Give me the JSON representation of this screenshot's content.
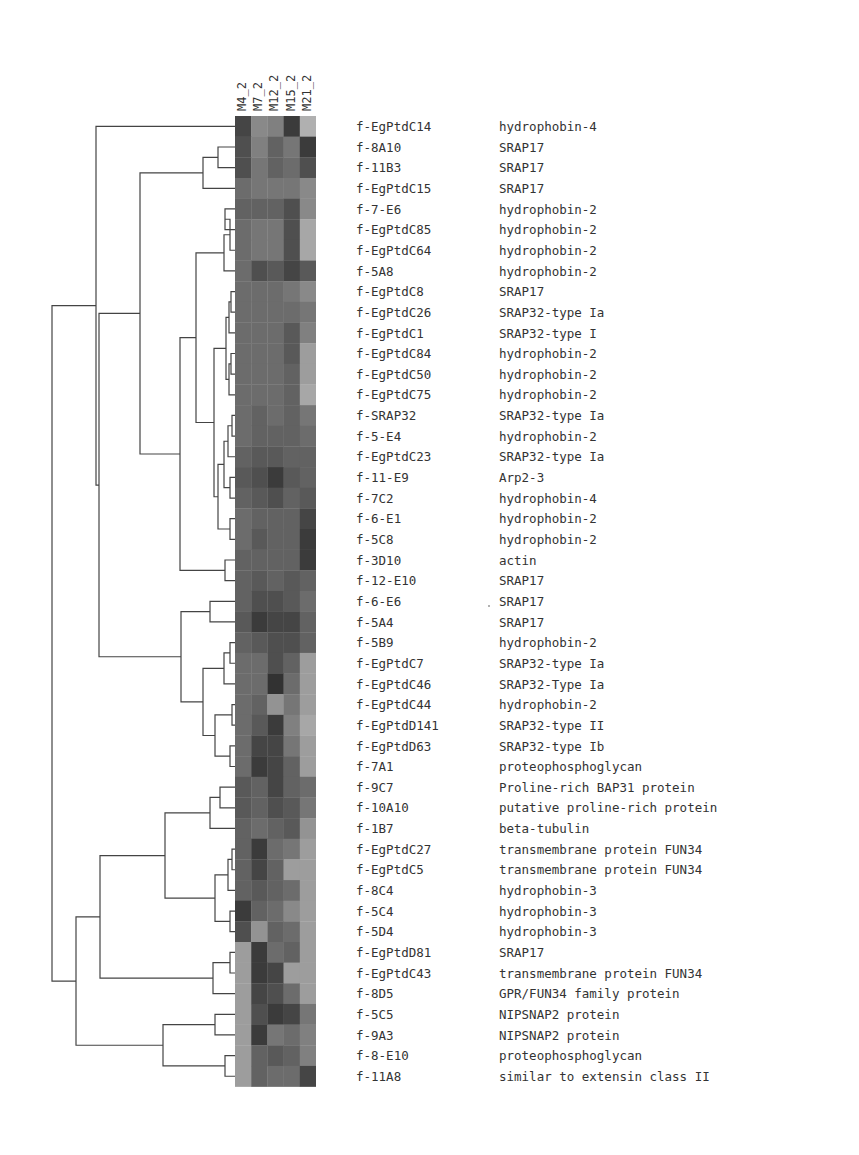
{
  "chart_data": {
    "type": "heatmap",
    "title": "",
    "columns": [
      "M4_2",
      "M7_2",
      "M12_2",
      "M15_2",
      "M21_2"
    ],
    "rows": [
      {
        "id": "f-EgPtdC14",
        "annotation": "hydrophobin-4",
        "values": [
          0.2,
          0.55,
          0.5,
          0.15,
          0.75
        ]
      },
      {
        "id": "f-8A10",
        "annotation": "SRAP17",
        "values": [
          0.25,
          0.5,
          0.35,
          0.45,
          0.15
        ]
      },
      {
        "id": "f-11B3",
        "annotation": "SRAP17",
        "values": [
          0.25,
          0.45,
          0.35,
          0.4,
          0.25
        ]
      },
      {
        "id": "f-EgPtdC15",
        "annotation": "SRAP17",
        "values": [
          0.4,
          0.45,
          0.45,
          0.45,
          0.55
        ]
      },
      {
        "id": "f-7-E6",
        "annotation": "hydrophobin-2",
        "values": [
          0.35,
          0.35,
          0.35,
          0.25,
          0.55
        ]
      },
      {
        "id": "f-EgPtdC85",
        "annotation": "hydrophobin-2",
        "values": [
          0.4,
          0.45,
          0.45,
          0.25,
          0.7
        ]
      },
      {
        "id": "f-EgPtdC64",
        "annotation": "hydrophobin-2",
        "values": [
          0.4,
          0.45,
          0.45,
          0.25,
          0.7
        ]
      },
      {
        "id": "f-5A8",
        "annotation": "hydrophobin-2",
        "values": [
          0.4,
          0.25,
          0.3,
          0.2,
          0.3
        ]
      },
      {
        "id": "f-EgPtdC8",
        "annotation": "SRAP17",
        "values": [
          0.4,
          0.4,
          0.4,
          0.45,
          0.55
        ]
      },
      {
        "id": "f-EgPtdC26",
        "annotation": "SRAP32-type Ia",
        "values": [
          0.4,
          0.4,
          0.4,
          0.4,
          0.45
        ]
      },
      {
        "id": "f-EgPtdC1",
        "annotation": "SRAP32-type I",
        "values": [
          0.4,
          0.4,
          0.4,
          0.3,
          0.5
        ]
      },
      {
        "id": "f-EgPtdC84",
        "annotation": "hydrophobin-2",
        "values": [
          0.4,
          0.4,
          0.4,
          0.3,
          0.65
        ]
      },
      {
        "id": "f-EgPtdC50",
        "annotation": "hydrophobin-2",
        "values": [
          0.4,
          0.4,
          0.4,
          0.35,
          0.65
        ]
      },
      {
        "id": "f-EgPtdC75",
        "annotation": "hydrophobin-2",
        "values": [
          0.4,
          0.4,
          0.4,
          0.35,
          0.7
        ]
      },
      {
        "id": "f-SRAP32",
        "annotation": "SRAP32-type Ia",
        "values": [
          0.4,
          0.35,
          0.4,
          0.35,
          0.45
        ]
      },
      {
        "id": "f-5-E4",
        "annotation": "hydrophobin-2",
        "values": [
          0.4,
          0.35,
          0.35,
          0.35,
          0.4
        ]
      },
      {
        "id": "f-EgPtdC23",
        "annotation": "SRAP32-type Ia",
        "values": [
          0.35,
          0.3,
          0.3,
          0.35,
          0.35
        ]
      },
      {
        "id": "f-11-E9",
        "annotation": "Arp2-3",
        "values": [
          0.3,
          0.25,
          0.15,
          0.3,
          0.35
        ]
      },
      {
        "id": "f-7C2",
        "annotation": "hydrophobin-4",
        "values": [
          0.35,
          0.3,
          0.25,
          0.35,
          0.3
        ]
      },
      {
        "id": "f-6-E1",
        "annotation": "hydrophobin-2",
        "values": [
          0.4,
          0.35,
          0.35,
          0.35,
          0.2
        ]
      },
      {
        "id": "f-5C8",
        "annotation": "hydrophobin-2",
        "values": [
          0.4,
          0.3,
          0.35,
          0.35,
          0.15
        ]
      },
      {
        "id": "f-3D10",
        "annotation": "actin",
        "values": [
          0.35,
          0.35,
          0.35,
          0.35,
          0.15
        ]
      },
      {
        "id": "f-12-E10",
        "annotation": "SRAP17",
        "values": [
          0.35,
          0.3,
          0.35,
          0.3,
          0.35
        ]
      },
      {
        "id": "f-6-E6",
        "annotation": "SRAP17",
        "values": [
          0.35,
          0.25,
          0.25,
          0.3,
          0.4
        ]
      },
      {
        "id": "f-5A4",
        "annotation": "SRAP17",
        "values": [
          0.3,
          0.15,
          0.2,
          0.2,
          0.35
        ]
      },
      {
        "id": "f-5B9",
        "annotation": "hydrophobin-2",
        "values": [
          0.35,
          0.3,
          0.25,
          0.25,
          0.35
        ]
      },
      {
        "id": "f-EgPtdC7",
        "annotation": "SRAP32-type Ia",
        "values": [
          0.4,
          0.4,
          0.25,
          0.35,
          0.65
        ]
      },
      {
        "id": "f-EgPtdC46",
        "annotation": "SRAP32-Type Ia",
        "values": [
          0.4,
          0.4,
          0.1,
          0.4,
          0.65
        ]
      },
      {
        "id": "f-EgPtdC44",
        "annotation": "hydrophobin-2",
        "values": [
          0.4,
          0.35,
          0.6,
          0.45,
          0.65
        ]
      },
      {
        "id": "f-EgPtdD141",
        "annotation": "SRAP32-type II",
        "values": [
          0.4,
          0.3,
          0.15,
          0.5,
          0.7
        ]
      },
      {
        "id": "f-EgPtdD63",
        "annotation": "SRAP32-type Ib",
        "values": [
          0.4,
          0.2,
          0.2,
          0.45,
          0.65
        ]
      },
      {
        "id": "f-7A1",
        "annotation": "proteophosphoglycan",
        "values": [
          0.4,
          0.15,
          0.2,
          0.35,
          0.65
        ]
      },
      {
        "id": "f-9C7",
        "annotation": "Proline-rich BAP31 protein",
        "values": [
          0.3,
          0.35,
          0.2,
          0.35,
          0.4
        ]
      },
      {
        "id": "f-10A10",
        "annotation": "putative proline-rich protein",
        "values": [
          0.3,
          0.35,
          0.25,
          0.3,
          0.45
        ]
      },
      {
        "id": "f-1B7",
        "annotation": "beta-tubulin",
        "values": [
          0.35,
          0.4,
          0.35,
          0.3,
          0.6
        ]
      },
      {
        "id": "f-EgPtdC27",
        "annotation": "transmembrane protein FUN34",
        "values": [
          0.35,
          0.15,
          0.4,
          0.45,
          0.65
        ]
      },
      {
        "id": "f-EgPtdC5",
        "annotation": "transmembrane protein FUN34",
        "values": [
          0.35,
          0.2,
          0.35,
          0.65,
          0.65
        ]
      },
      {
        "id": "f-8C4",
        "annotation": "hydrophobin-3",
        "values": [
          0.35,
          0.3,
          0.35,
          0.4,
          0.65
        ]
      },
      {
        "id": "f-5C4",
        "annotation": "hydrophobin-3",
        "values": [
          0.15,
          0.35,
          0.4,
          0.55,
          0.65
        ]
      },
      {
        "id": "f-5D4",
        "annotation": "hydrophobin-3",
        "values": [
          0.25,
          0.6,
          0.35,
          0.4,
          0.65
        ]
      },
      {
        "id": "f-EgPtdD81",
        "annotation": "SRAP17",
        "values": [
          0.65,
          0.15,
          0.4,
          0.35,
          0.65
        ]
      },
      {
        "id": "f-EgPtdC43",
        "annotation": "transmembrane protein FUN34",
        "values": [
          0.65,
          0.15,
          0.2,
          0.65,
          0.65
        ]
      },
      {
        "id": "f-8D5",
        "annotation": "GPR/FUN34 family protein",
        "values": [
          0.65,
          0.2,
          0.25,
          0.4,
          0.65
        ]
      },
      {
        "id": "f-5C5",
        "annotation": "NIPSNAP2 protein",
        "values": [
          0.65,
          0.25,
          0.15,
          0.2,
          0.45
        ]
      },
      {
        "id": "f-9A3",
        "annotation": "NIPSNAP2 protein",
        "values": [
          0.65,
          0.15,
          0.45,
          0.4,
          0.5
        ]
      },
      {
        "id": "f-8-E10",
        "annotation": "proteophosphoglycan",
        "values": [
          0.65,
          0.35,
          0.3,
          0.35,
          0.5
        ]
      },
      {
        "id": "f-11A8",
        "annotation": "similar to extensin class II",
        "values": [
          0.65,
          0.35,
          0.4,
          0.4,
          0.2
        ]
      }
    ],
    "color_scale": {
      "low": "#1e1e1e",
      "high": "#cfcfcf",
      "note": "grayscale, darker = higher intensity"
    },
    "dendrogram": "hierarchical clustering tree on rows (left side)",
    "legend": "none",
    "grid": false
  },
  "layout": {
    "row_pitch": 20.65,
    "first_row_top": 116,
    "cell_width": 16.2,
    "cell_height": 20.65
  }
}
